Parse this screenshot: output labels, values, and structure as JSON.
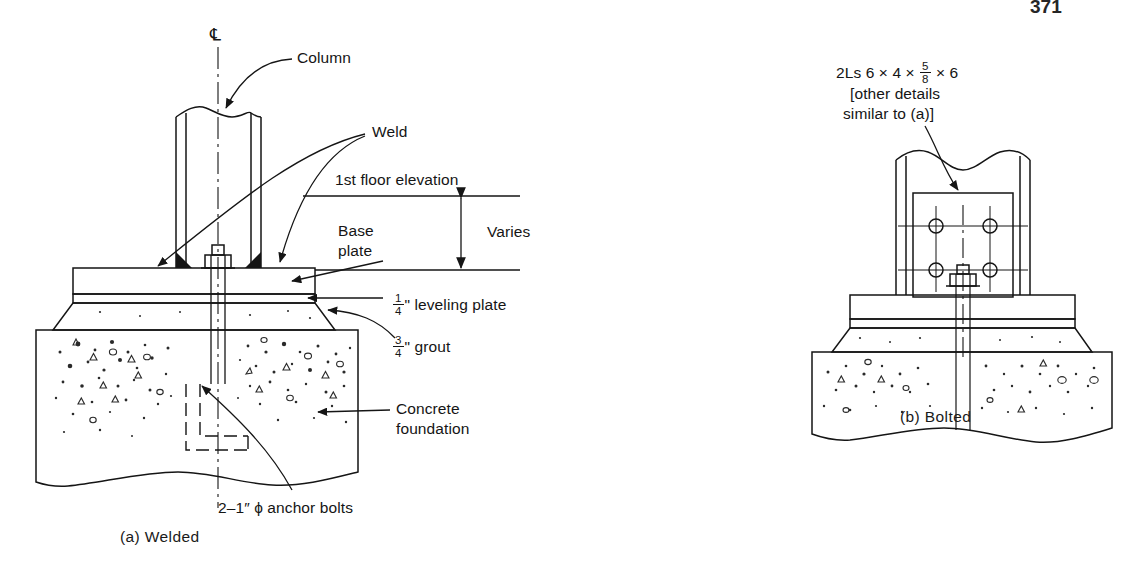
{
  "page": {
    "number": "371",
    "background": "#ffffff",
    "ink": "#151515"
  },
  "figure": {
    "panels": [
      {
        "id": "a",
        "caption": "(a)  Welded",
        "labels": {
          "centerline": "℄",
          "column": "Column",
          "weld": "Weld",
          "first_floor_elevation": "1st floor elevation",
          "base_plate_line1": "Base",
          "base_plate_line2": "plate",
          "varies": "Varies",
          "leveling_plate_num": "1",
          "leveling_plate_den": "4",
          "leveling_plate_text": "\" leveling plate",
          "grout_num": "3",
          "grout_den": "4",
          "grout_text": "\" grout",
          "concrete_line1": "Concrete",
          "concrete_line2": "foundation",
          "anchor_bolts": "2–1″ ϕ anchor bolts"
        }
      },
      {
        "id": "b",
        "caption": "(b)  Bolted",
        "labels": {
          "angles_prefix": "2Ls 6 × 4 ×",
          "angles_num": "5",
          "angles_den": "8",
          "angles_suffix": "× 6",
          "note_line1": "[other details",
          "note_line2": "similar to (a)]"
        }
      }
    ]
  }
}
